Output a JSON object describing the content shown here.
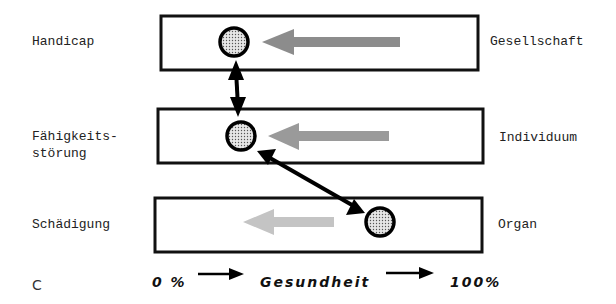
{
  "diagram": {
    "levels": [
      {
        "left_label": "Handicap",
        "right_label": "Gesellschaft"
      },
      {
        "left_label": "Fähigkeits-\nstörung",
        "right_label": "Individuum"
      },
      {
        "left_label": "Schädigung",
        "right_label": "Organ"
      }
    ],
    "figure_mark": "C",
    "axis": {
      "start": "0 %",
      "middle": "Gesundheit",
      "end": "100%"
    },
    "colors": {
      "box_border": "#111111",
      "arrow_dark_gray": "#8c8c8c",
      "arrow_mid_gray": "#9a9a9a",
      "arrow_light_gray": "#c4c4c4",
      "circle_fill": "#d8d8d8",
      "connector": "#000000"
    }
  }
}
